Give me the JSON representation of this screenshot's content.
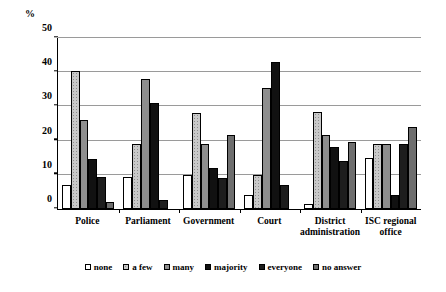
{
  "chart_data": {
    "type": "bar",
    "title": "",
    "xlabel": "",
    "ylabel": "%",
    "ylim": [
      0,
      50
    ],
    "yticks": [
      0,
      10,
      20,
      30,
      40,
      50
    ],
    "grid": true,
    "legend_position": "bottom",
    "categories": [
      "Police",
      "Parliament",
      "Government",
      "Court",
      "District administration",
      "ISC regional office"
    ],
    "series": [
      {
        "name": "none",
        "color": "#ffffff",
        "values": [
          7,
          9.5,
          10,
          4,
          1.5,
          15
        ]
      },
      {
        "name": "a few",
        "color": "#c9c9c9",
        "values": [
          40.5,
          19,
          28,
          10,
          28.5,
          19
        ]
      },
      {
        "name": "many",
        "color": "#8e8e8e",
        "values": [
          26,
          38,
          19,
          35.5,
          21.5,
          19
        ]
      },
      {
        "name": "majority",
        "color": "#111111",
        "values": [
          14.5,
          31,
          12,
          43,
          18,
          4
        ]
      },
      {
        "name": "everyone",
        "color": "#1d1d1d",
        "values": [
          9.5,
          2.5,
          9,
          7,
          14,
          19
        ]
      },
      {
        "name": "no answer",
        "color": "#6e6e6e",
        "values": [
          2,
          0,
          21.5,
          0,
          19.5,
          24
        ]
      }
    ]
  },
  "legend": {
    "items": [
      {
        "label": "none"
      },
      {
        "label": "a few"
      },
      {
        "label": "many"
      },
      {
        "label": "majority"
      },
      {
        "label": "everyone"
      },
      {
        "label": "no answer"
      }
    ]
  }
}
